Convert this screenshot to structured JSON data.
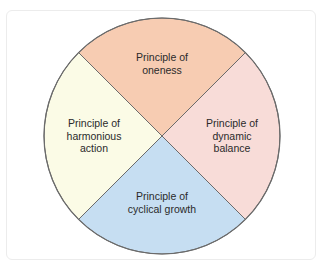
{
  "diagram": {
    "type": "quadrant-circle",
    "colors": {
      "top": "#f7ccb2",
      "right": "#f8dcd8",
      "bottom": "#c6def2",
      "left": "#fbfbe6",
      "stroke": "#6b6b6b"
    },
    "segments": [
      {
        "position": "top",
        "line1": "Principle of",
        "line2": "oneness",
        "line3": ""
      },
      {
        "position": "right",
        "line1": "Principle of",
        "line2": "dynamic",
        "line3": "balance"
      },
      {
        "position": "bottom",
        "line1": "Principle of",
        "line2": "cyclical growth",
        "line3": ""
      },
      {
        "position": "left",
        "line1": "Principle of",
        "line2": "harmonious",
        "line3": "action"
      }
    ]
  }
}
